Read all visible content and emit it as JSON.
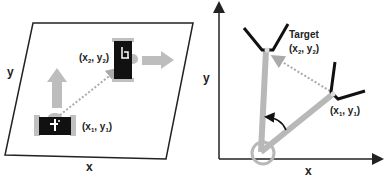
{
  "left_panel": {
    "axis_x_label": "x",
    "axis_y_label": "y",
    "start_label": {
      "main": "(x",
      "sub1": "1",
      "sep": ", y",
      "sub2": "1",
      "close": ")"
    },
    "end_label": {
      "main": "(x",
      "sub1": "2",
      "sep": ", y",
      "sub2": "2",
      "close": ")"
    }
  },
  "right_panel": {
    "axis_x_label": "x",
    "axis_y_label": "y",
    "target_title": "Target",
    "target_label": {
      "main": "(x",
      "sub1": "2",
      "sep": ", y",
      "sub2": "2",
      "close": ")"
    },
    "start_label": {
      "main": "(x",
      "sub1": "1",
      "sep": ", y",
      "sub2": "1",
      "close": ")"
    }
  },
  "colors": {
    "line": "#222222",
    "gray": "#b8b8b8",
    "robot_body": "#111111",
    "dotted": "#aaaaaa"
  }
}
